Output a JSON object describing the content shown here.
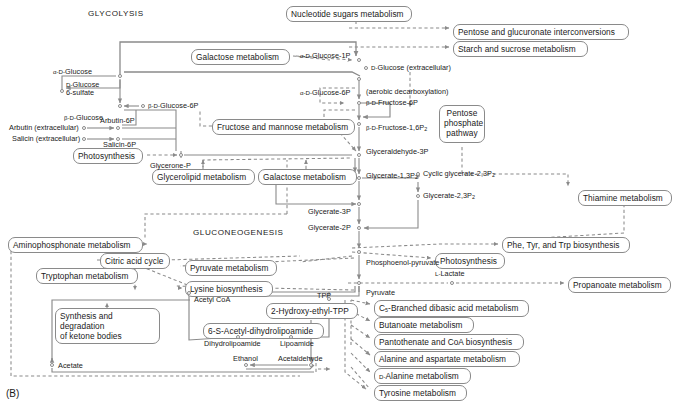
{
  "figure": {
    "panel_label": "(B)",
    "captions": [
      {
        "text": "GLYCOLYSIS",
        "x": 88,
        "y": 9
      },
      {
        "text": "GLUCONEOGENESIS",
        "x": 193,
        "y": 228
      }
    ],
    "line_color": "#8a8a8a",
    "text_color": "#1a1a1a",
    "background": "#ffffff"
  },
  "pathway_boxes": [
    {
      "name": "nucleotide-sugars-metabolism",
      "label": "Nucleotide sugars metabolism",
      "x": 286,
      "y": 6,
      "w": 126,
      "h": 14
    },
    {
      "name": "pentose-and-glucuronate-interconversions",
      "label": "Pentose and glucuronate interconversions",
      "x": 453,
      "y": 24,
      "w": 176,
      "h": 14
    },
    {
      "name": "starch-and-sucrose-metabolism",
      "label": "Starch and sucrose metabolism",
      "x": 453,
      "y": 41,
      "w": 135,
      "h": 14
    },
    {
      "name": "galactose-metabolism-top",
      "label": "Galactose metabolism",
      "x": 191,
      "y": 49,
      "w": 99,
      "h": 14
    },
    {
      "name": "fructose-and-mannose-metabolism",
      "label": "Fructose and mannose metabolism",
      "x": 212,
      "y": 119,
      "w": 143,
      "h": 14
    },
    {
      "name": "pentose-phosphate-pathway",
      "label": "Pentose\nphosphate\npathway",
      "x": 439,
      "y": 105,
      "w": 46,
      "h": 38
    },
    {
      "name": "photosynthesis-left",
      "label": "Photosynthesis",
      "x": 73,
      "y": 148,
      "w": 70,
      "h": 14
    },
    {
      "name": "glycerolipid-metabolism",
      "label": "Glycerolipid metabolism",
      "x": 152,
      "y": 169,
      "w": 103,
      "h": 14
    },
    {
      "name": "galactose-metabolism-mid",
      "label": "Galactose metabolism",
      "x": 258,
      "y": 169,
      "w": 99,
      "h": 14
    },
    {
      "name": "thiamine-metabolism",
      "label": "Thiamine metabolism",
      "x": 578,
      "y": 190,
      "w": 94,
      "h": 14
    },
    {
      "name": "aminophosphonate-metabolism",
      "label": "Aminophosphonate metabolism",
      "x": 8,
      "y": 237,
      "w": 135,
      "h": 14
    },
    {
      "name": "phe-tyr-trp-biosynthesis",
      "label": "Phe, Tyr, and Trp biosynthesis",
      "x": 502,
      "y": 237,
      "w": 128,
      "h": 14
    },
    {
      "name": "citric-acid-cycle",
      "label": "Citric acid cycle",
      "x": 100,
      "y": 253,
      "w": 70,
      "h": 14
    },
    {
      "name": "pyruvate-metabolism",
      "label": "Pyruvate metabolism",
      "x": 185,
      "y": 260,
      "w": 92,
      "h": 14
    },
    {
      "name": "photosynthesis-mid",
      "label": "Photosynthesis",
      "x": 435,
      "y": 253,
      "w": 70,
      "h": 14
    },
    {
      "name": "tryptophan-metabolism",
      "label": "Tryptophan metabolism",
      "x": 36,
      "y": 268,
      "w": 102,
      "h": 14
    },
    {
      "name": "lysine-biosynthesis",
      "label": "Lysine biosynthesis",
      "x": 185,
      "y": 281,
      "w": 88,
      "h": 14
    },
    {
      "name": "propanoate-metabolism",
      "label": "Propanoate metabolism",
      "x": 568,
      "y": 277,
      "w": 103,
      "h": 14
    },
    {
      "name": "c5-branched-dibasic-acid-metabolism",
      "label": "C5-Branched dibasic acid metabolism",
      "x": 374,
      "y": 300,
      "w": 155,
      "h": 14
    },
    {
      "name": "synthesis-and-degradation-of-ketone-bodies",
      "label": "Synthesis and degradation\nof ketone bodies",
      "x": 55,
      "y": 308,
      "w": 105,
      "h": 24
    },
    {
      "name": "2-hydroxy-ethyl-tpp",
      "label": "2-Hydroxy-ethyl-TPP",
      "x": 266,
      "y": 303,
      "w": 92,
      "h": 14
    },
    {
      "name": "butanoate-metabolism",
      "label": "Butanoate metabolism",
      "x": 374,
      "y": 317,
      "w": 100,
      "h": 14
    },
    {
      "name": "6-s-acetyl-dihydrolipoamide",
      "label": "6-S-Acetyl-dihydrolipoamide",
      "x": 203,
      "y": 323,
      "w": 121,
      "h": 14
    },
    {
      "name": "pantothenate-and-coa-biosynthesis",
      "label": "Pantothenate and CoA biosynthesis",
      "x": 374,
      "y": 334,
      "w": 150,
      "h": 14
    },
    {
      "name": "alanine-and-aspartate-metabolism",
      "label": "Alanine and aspartate metabolism",
      "x": 374,
      "y": 351,
      "w": 146,
      "h": 14
    },
    {
      "name": "d-alanine-metabolism",
      "label": "D-Alanine metabolism",
      "x": 374,
      "y": 368,
      "w": 97,
      "h": 14
    },
    {
      "name": "tyrosine-metabolism",
      "label": "Tyrosine metabolism",
      "x": 374,
      "y": 385,
      "w": 93,
      "h": 14
    }
  ],
  "compounds": [
    {
      "name": "alpha-d-glucose",
      "label": "α-D-Glucose",
      "x": 53,
      "y": 68,
      "align": "left",
      "dot_x": 120,
      "dot_y": 76
    },
    {
      "name": "d-glucose-6-sulfate",
      "label": "D-Glucose\n6-sulfate",
      "x": 66,
      "y": 81,
      "align": "left",
      "dot_x": 62,
      "dot_y": 91
    },
    {
      "name": "beta-d-glucose",
      "label": "β-D-Glucose",
      "x": 64,
      "y": 114,
      "align": "left",
      "dot_x": 120,
      "dot_y": 106
    },
    {
      "name": "beta-d-glucose-6p",
      "label": "β-D-Glucose-6P",
      "x": 148,
      "y": 102,
      "align": "left",
      "dot_x": 143,
      "dot_y": 106
    },
    {
      "name": "arbutin-extracellular",
      "label": "Arbutin (extracellular)",
      "x": 9,
      "y": 124,
      "align": "left",
      "dot_x": 84,
      "dot_y": 128
    },
    {
      "name": "arbutin-6p",
      "label": "Arbutin-6P",
      "x": 100,
      "y": 117,
      "align": "left",
      "dot_x": 118,
      "dot_y": 128
    },
    {
      "name": "salicin-extracellular",
      "label": "Salicin (extracellular)",
      "x": 12,
      "y": 135,
      "align": "left",
      "dot_x": 84,
      "dot_y": 139
    },
    {
      "name": "salicin-6p",
      "label": "Salicin-6P",
      "x": 103,
      "y": 141,
      "align": "left",
      "dot_x": 118,
      "dot_y": 139
    },
    {
      "name": "alpha-d-glucose-1p",
      "label": "α-D-Glucose-1P",
      "x": 300,
      "y": 52,
      "align": "left",
      "dot_x": 359,
      "dot_y": 60
    },
    {
      "name": "d-glucose-extracellular",
      "label": "D-Glucose (extracellular)",
      "x": 371,
      "y": 64,
      "align": "left",
      "dot_x": 366,
      "dot_y": 68
    },
    {
      "name": "alpha-d-glucose-6p",
      "label": "α-D-Glucose-6P",
      "x": 300,
      "y": 89,
      "align": "left",
      "dot_x": 359,
      "dot_y": 79
    },
    {
      "name": "aerobic-decarboxylation",
      "label": "(aerobic decarboxylation)",
      "x": 366,
      "y": 88,
      "align": "left",
      "dot_x": null,
      "dot_y": null
    },
    {
      "name": "beta-d-fructose-6p",
      "label": "β-D-Fructose-6P",
      "x": 366,
      "y": 99,
      "align": "left",
      "dot_x": 359,
      "dot_y": 103
    },
    {
      "name": "beta-d-fructose-16p2",
      "label": "β-D-Fructose-1,6P2",
      "x": 366,
      "y": 124,
      "align": "left",
      "dot_x": 359,
      "dot_y": 124
    },
    {
      "name": "glyceraldehyde-3p",
      "label": "Glyceraldehyde-3P",
      "x": 366,
      "y": 148,
      "align": "left",
      "dot_x": 359,
      "dot_y": 155
    },
    {
      "name": "glycerone-p",
      "label": "Glycerone-P",
      "x": 150,
      "y": 162,
      "align": "left",
      "dot_x": 181,
      "dot_y": 155
    },
    {
      "name": "glycerate-13p2",
      "label": "Glycerate-1,3P2",
      "x": 366,
      "y": 172,
      "align": "left",
      "dot_x": 359,
      "dot_y": 178
    },
    {
      "name": "cyclic-glycerate-23p2",
      "label": "Cyclic glycerate-2,3P2",
      "x": 423,
      "y": 170,
      "align": "left",
      "dot_x": 418,
      "dot_y": 174
    },
    {
      "name": "glycerate-23p2",
      "label": "Glycerate-2,3P2",
      "x": 423,
      "y": 192,
      "align": "left",
      "dot_x": 418,
      "dot_y": 196
    },
    {
      "name": "glycerate-3p",
      "label": "Glycerate-3P",
      "x": 308,
      "y": 208,
      "align": "left",
      "dot_x": 359,
      "dot_y": 204
    },
    {
      "name": "glycerate-2p",
      "label": "Glycerate-2P",
      "x": 308,
      "y": 224,
      "align": "left",
      "dot_x": 359,
      "dot_y": 228
    },
    {
      "name": "phosphoenol-pyruvate",
      "label": "Phosphoenol-pyruvate",
      "x": 366,
      "y": 259,
      "align": "left",
      "dot_x": 359,
      "dot_y": 252
    },
    {
      "name": "l-lactate",
      "label": "L-Lactate",
      "x": 435,
      "y": 270,
      "align": "left",
      "dot_x": 452,
      "dot_y": 283
    },
    {
      "name": "pyruvate",
      "label": "Pyruvate",
      "x": 366,
      "y": 289,
      "align": "left",
      "dot_x": 359,
      "dot_y": 283
    },
    {
      "name": "acetyl-coa",
      "label": "Acetyl CoA",
      "x": 194,
      "y": 296,
      "align": "left",
      "dot_x": 189,
      "dot_y": 293
    },
    {
      "name": "tpp",
      "label": "TPP",
      "x": 317,
      "y": 292,
      "align": "left",
      "dot_x": 329,
      "dot_y": 299
    },
    {
      "name": "dihydrolipoamide",
      "label": "Dihydrolipoamide",
      "x": 204,
      "y": 340,
      "align": "left",
      "dot_x": 238,
      "dot_y": 337
    },
    {
      "name": "lipoamide",
      "label": "Lipoamide",
      "x": 280,
      "y": 340,
      "align": "left",
      "dot_x": 291,
      "dot_y": 337
    },
    {
      "name": "ethanol",
      "label": "Ethanol",
      "x": 233,
      "y": 355,
      "align": "left",
      "dot_x": 246,
      "dot_y": 365
    },
    {
      "name": "acetaldehyde",
      "label": "Acetaldehyde",
      "x": 278,
      "y": 355,
      "align": "left",
      "dot_x": 311,
      "dot_y": 365
    },
    {
      "name": "acetate",
      "label": "Acetate",
      "x": 58,
      "y": 362,
      "align": "left",
      "dot_x": 52,
      "dot_y": 365
    }
  ]
}
